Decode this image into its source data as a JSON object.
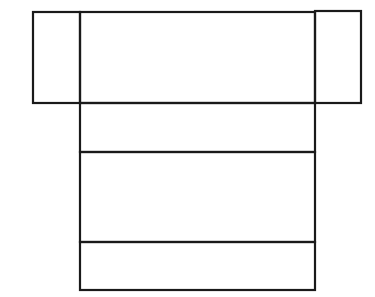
{
  "diagram": {
    "type": "net-of-rectangular-prism",
    "stroke_color": "#1a1a1a",
    "background": "#ffffff",
    "stroke_width": 2.2,
    "faces": [
      {
        "name": "left-flap",
        "x": 33,
        "y": 12,
        "w": 47,
        "h": 91
      },
      {
        "name": "top-center",
        "x": 80,
        "y": 12,
        "w": 235,
        "h": 91
      },
      {
        "name": "right-flap",
        "x": 315,
        "y": 11,
        "w": 46,
        "h": 92
      },
      {
        "name": "middle-short",
        "x": 80,
        "y": 103,
        "w": 235,
        "h": 49
      },
      {
        "name": "middle-tall",
        "x": 80,
        "y": 152,
        "w": 235,
        "h": 90
      },
      {
        "name": "bottom-short",
        "x": 80,
        "y": 242,
        "w": 235,
        "h": 48
      }
    ]
  }
}
